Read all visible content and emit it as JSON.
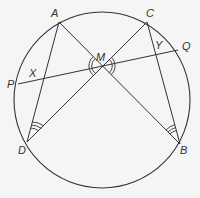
{
  "diagram": {
    "title": "",
    "circle": {
      "cx": 102,
      "cy": 100,
      "r": 88
    },
    "points": {
      "A": {
        "label": "A",
        "x": 59,
        "y": 22,
        "lx": 51,
        "ly": 17
      },
      "C": {
        "label": "C",
        "x": 147,
        "y": 22,
        "lx": 146,
        "ly": 17
      },
      "P": {
        "label": "P",
        "x": 18,
        "y": 84,
        "lx": 7,
        "ly": 88
      },
      "Q": {
        "label": "Q",
        "x": 178,
        "y": 50,
        "lx": 182,
        "ly": 50
      },
      "D": {
        "label": "D",
        "x": 27,
        "y": 142,
        "lx": 18,
        "ly": 154
      },
      "B": {
        "label": "B",
        "x": 180,
        "y": 144,
        "lx": 180,
        "ly": 154
      },
      "M": {
        "label": "M",
        "x": 102,
        "y": 66,
        "lx": 96,
        "ly": 61
      },
      "X": {
        "label": "X",
        "lx": 29,
        "ly": 77
      },
      "Y": {
        "label": "Y",
        "lx": 155,
        "ly": 49
      }
    },
    "segments": [
      [
        "A",
        "D"
      ],
      [
        "A",
        "B"
      ],
      [
        "C",
        "D"
      ],
      [
        "C",
        "B"
      ],
      [
        "P",
        "Q"
      ]
    ],
    "angle_marks": [
      {
        "at": "M",
        "type": "double-arc",
        "side": "left"
      },
      {
        "at": "M",
        "type": "double-arc",
        "side": "right"
      },
      {
        "at": "D",
        "type": "triple-arc"
      },
      {
        "at": "B",
        "type": "triple-arc"
      }
    ],
    "colors": {
      "stroke": "#333333",
      "background": "#f5f5f5"
    }
  }
}
